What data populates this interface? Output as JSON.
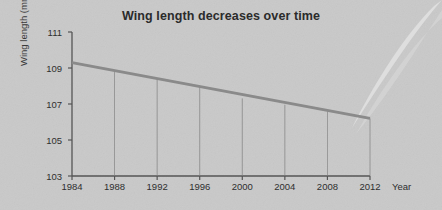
{
  "chart_data": {
    "type": "line",
    "title": "Wing length decreases over time",
    "xlabel": "Year",
    "ylabel": "Wing length (mm)",
    "xlim": [
      1984,
      2012
    ],
    "ylim": [
      103,
      111
    ],
    "xticks": [
      1984,
      1988,
      1992,
      1996,
      2000,
      2004,
      2008,
      2012
    ],
    "yticks": [
      103,
      105,
      107,
      109,
      111
    ],
    "grid": false,
    "legend": null,
    "drop_lines": true,
    "series": [
      {
        "name": "Wing length trend",
        "color": "#8a8a8a",
        "x": [
          1984,
          1988,
          1992,
          1996,
          2000,
          2004,
          2008,
          2012
        ],
        "values": [
          109.3,
          108.85,
          108.4,
          107.96,
          107.31,
          106.96,
          106.6,
          106.2
        ]
      }
    ],
    "annotations": []
  },
  "style": {
    "background": "#c9c9c9",
    "axis_color": "#555555",
    "text_color": "#2f2f2f",
    "title_color": "#2b2b2b",
    "line_color": "#8a8a8a",
    "drop_line_color": "#7d7d7d"
  }
}
